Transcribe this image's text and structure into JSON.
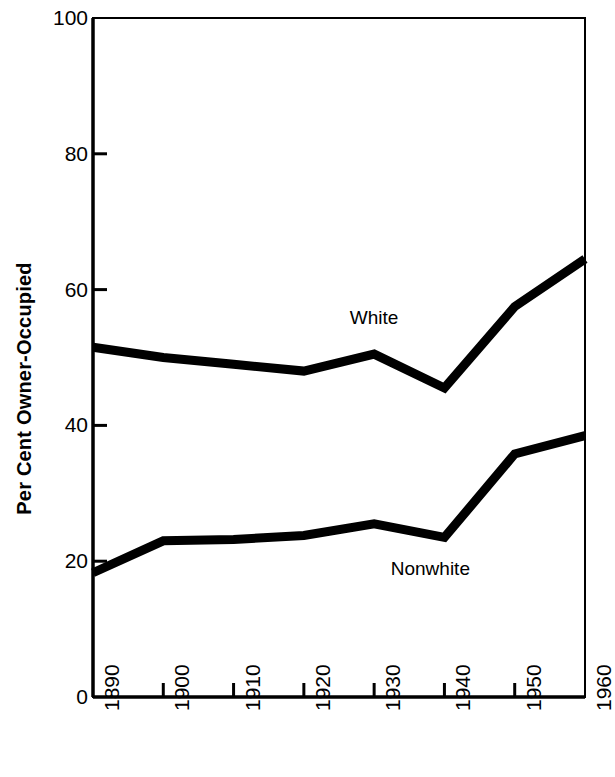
{
  "chart_data": {
    "type": "line",
    "title": "",
    "xlabel": "",
    "ylabel": "Per Cent Owner-Occupied",
    "x": [
      1890,
      1900,
      1910,
      1920,
      1930,
      1940,
      1950,
      1960
    ],
    "xtick_labels": [
      "1890",
      "1900",
      "1910",
      "1920",
      "1930",
      "1940",
      "1950",
      "1960"
    ],
    "xlim": [
      1890,
      1960
    ],
    "ylim": [
      0,
      100
    ],
    "ytick_labels": [
      "0",
      "20",
      "40",
      "60",
      "80",
      "100"
    ],
    "yticks": [
      0,
      20,
      40,
      60,
      80,
      100
    ],
    "grid": false,
    "legend_position": "inline-annotation",
    "line_color": "#000000",
    "background_color": "#ffffff",
    "series": [
      {
        "name": "White",
        "values": [
          51.5,
          50.0,
          49.0,
          48.0,
          50.5,
          45.5,
          57.5,
          64.5
        ],
        "label_x": 1930,
        "label_y": 56
      },
      {
        "name": "Nonwhite",
        "values": [
          18.3,
          23.0,
          23.2,
          23.8,
          25.5,
          23.5,
          35.8,
          38.5
        ],
        "label_x": 1938,
        "label_y": 19
      }
    ]
  }
}
